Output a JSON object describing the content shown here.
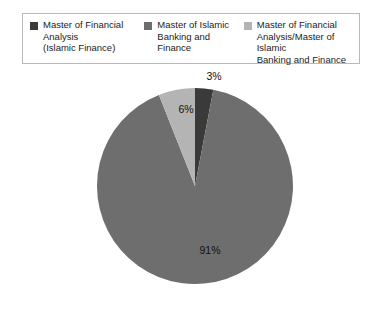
{
  "legend": {
    "entries": [
      {
        "label": "Master of Financial\nAnalysis\n(Islamic Finance)",
        "color": "#3a3a3a"
      },
      {
        "label": "Master of Islamic\nBanking and\nFinance",
        "color": "#6e6e6e"
      },
      {
        "label": "Master of Financial\nAnalysis/Master of Islamic\nBanking and Finance",
        "color": "#b4b4b4"
      }
    ]
  },
  "chart_data": {
    "type": "pie",
    "title": "",
    "subtitle": "",
    "xlabel": "",
    "ylabel": "",
    "grid": false,
    "legend_position": "top",
    "start_angle_deg": 0,
    "direction": "clockwise",
    "categories": [
      "Master of Financial Analysis (Islamic Finance)",
      "Master of Islamic Banking and Finance",
      "Master of Financial Analysis/Master of Islamic Banking and Finance"
    ],
    "values": [
      3,
      91,
      6
    ],
    "value_unit": "%",
    "data_labels": [
      "3%",
      "91%",
      "6%"
    ],
    "colors": [
      "#3a3a3a",
      "#6e6e6e",
      "#b4b4b4"
    ],
    "slices": [
      {
        "name": "Master of Financial Analysis (Islamic Finance)",
        "value": 3,
        "label": "3%",
        "color": "#3a3a3a"
      },
      {
        "name": "Master of Islamic Banking and Finance",
        "value": 91,
        "label": "91%",
        "color": "#6e6e6e"
      },
      {
        "name": "Master of Financial Analysis/Master of Islamic Banking and Finance",
        "value": 6,
        "label": "6%",
        "color": "#b4b4b4"
      }
    ],
    "total": 100
  }
}
